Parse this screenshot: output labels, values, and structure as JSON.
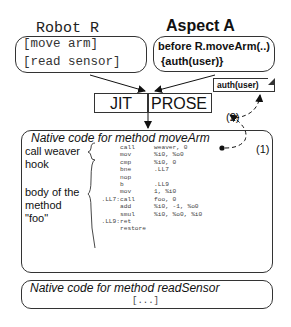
{
  "robot": {
    "title": "Robot R",
    "methods": [
      "[move arm]",
      "[read sensor]"
    ]
  },
  "aspect": {
    "title": "Aspect A",
    "lines": [
      "before R.moveArm(..)",
      " {auth(user)}"
    ]
  },
  "jit": {
    "left_label": "JIT",
    "right_label": "PROSE"
  },
  "note": {
    "label": "auth(user)"
  },
  "markers": {
    "step1": "(1)",
    "step2": "(2)"
  },
  "move_arm_block": {
    "title": "Native code for method moveArm",
    "labels": {
      "weaver_hook": [
        "call weaver",
        "hook"
      ],
      "body": [
        "body of the",
        "method",
        "\"foo\""
      ]
    },
    "asm": [
      {
        "label": "",
        "op": "call",
        "args": "weaver, 0",
        "bold": true
      },
      {
        "label": "",
        "op": "mov",
        "args": "%i0, %o0",
        "bold": true
      },
      {
        "label": "",
        "op": "cmp",
        "args": "%i0, 0",
        "bold": false
      },
      {
        "label": "",
        "op": "bne",
        "args": ".LL7",
        "bold": false
      },
      {
        "label": "",
        "op": "nop",
        "args": "",
        "bold": false
      },
      {
        "label": "",
        "op": "b",
        "args": ".LL9",
        "bold": false
      },
      {
        "label": "",
        "op": "mov",
        "args": "1, %i0",
        "bold": false
      },
      {
        "label": ".LL7:",
        "op": "call",
        "args": "foo, 0",
        "bold": false
      },
      {
        "label": "",
        "op": "add",
        "args": "%i0, -1, %o0",
        "bold": false
      },
      {
        "label": "",
        "op": "smul",
        "args": "%i0, %o0, %i0",
        "bold": false
      },
      {
        "label": ".LL9:",
        "op": "ret",
        "args": "",
        "bold": false
      },
      {
        "label": "",
        "op": "restore",
        "args": "",
        "bold": false
      }
    ]
  },
  "read_sensor_block": {
    "title": "Native code for method readSensor",
    "body": "[...]"
  }
}
